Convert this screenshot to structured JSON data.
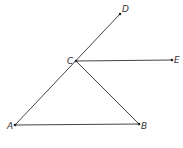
{
  "diagram": {
    "points": [
      {
        "name": "A",
        "x": 15,
        "y": 125,
        "lx": 7,
        "ly": 128
      },
      {
        "name": "B",
        "x": 139,
        "y": 124,
        "lx": 142,
        "ly": 128
      },
      {
        "name": "C",
        "x": 76,
        "y": 61,
        "lx": 68,
        "ly": 62
      },
      {
        "name": "D",
        "x": 120,
        "y": 14,
        "lx": 121,
        "ly": 12
      },
      {
        "name": "E",
        "x": 172,
        "y": 60,
        "lx": 174,
        "ly": 63
      }
    ],
    "segments": [
      [
        "A",
        "B"
      ],
      [
        "A",
        "D"
      ],
      [
        "C",
        "B"
      ],
      [
        "C",
        "E"
      ]
    ],
    "labels": {
      "A": "A",
      "B": "B",
      "C": "C",
      "D": "D",
      "E": "E"
    }
  }
}
